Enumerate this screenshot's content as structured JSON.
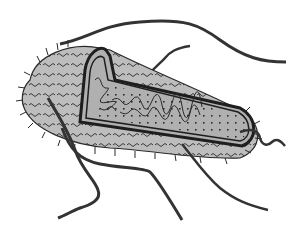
{
  "image": {
    "subject": "rod-shaped bacterium",
    "style": "grayscale line illustration",
    "colors": {
      "background": "#ffffff",
      "outline": "#2a2a2a",
      "capsule_fill": "#bdbdbd",
      "cytoplasm_fill": "#b0b0b0",
      "flagellum": "#333333"
    },
    "parts": {
      "flagella_count": 4,
      "cutaway": true,
      "pili": true,
      "ribosomes": true,
      "nucleoid": true
    }
  }
}
